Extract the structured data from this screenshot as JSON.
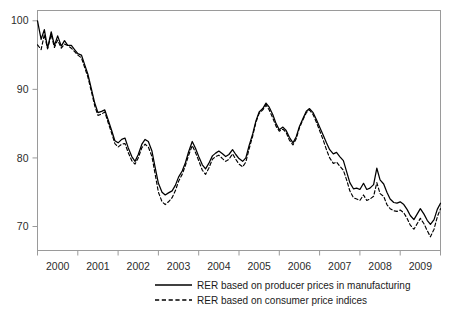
{
  "chart_data": {
    "type": "line",
    "title": "",
    "subtitle": "",
    "xlabel": "",
    "ylabel": "",
    "xlim": [
      1999.58,
      2009.58
    ],
    "ylim": [
      66.5,
      101.5
    ],
    "grid": false,
    "legend_position": "bottom-center",
    "yticks": [
      70,
      80,
      90,
      100
    ],
    "ytick_labels": [
      "70",
      "80",
      "90",
      "100"
    ],
    "xticks": [
      1999.58,
      2000.58,
      2001.58,
      2002.58,
      2003.58,
      2004.58,
      2005.58,
      2006.58,
      2007.58,
      2008.58,
      2009.58
    ],
    "xtick_labels": [
      "2000",
      "2001",
      "2002",
      "2003",
      "2004",
      "2005",
      "2006",
      "2007",
      "2008",
      "2009"
    ],
    "annotations": [],
    "series": [
      {
        "name": "RER based on producer prices in manufacturing",
        "style": "solid",
        "color": "#000000",
        "x": [
          1999.58,
          1999.67,
          1999.75,
          1999.83,
          1999.92,
          2000.0,
          2000.08,
          2000.17,
          2000.25,
          2000.33,
          2000.42,
          2000.5,
          2000.58,
          2000.67,
          2000.75,
          2000.83,
          2000.92,
          2001.0,
          2001.08,
          2001.17,
          2001.25,
          2001.33,
          2001.42,
          2001.5,
          2001.58,
          2001.67,
          2001.75,
          2001.83,
          2001.92,
          2002.0,
          2002.08,
          2002.17,
          2002.25,
          2002.33,
          2002.42,
          2002.5,
          2002.58,
          2002.67,
          2002.75,
          2002.83,
          2002.92,
          2003.0,
          2003.08,
          2003.17,
          2003.25,
          2003.33,
          2003.42,
          2003.5,
          2003.58,
          2003.67,
          2003.75,
          2003.83,
          2003.92,
          2004.0,
          2004.08,
          2004.17,
          2004.25,
          2004.33,
          2004.42,
          2004.5,
          2004.58,
          2004.67,
          2004.75,
          2004.83,
          2004.92,
          2005.0,
          2005.08,
          2005.17,
          2005.25,
          2005.33,
          2005.42,
          2005.5,
          2005.58,
          2005.67,
          2005.75,
          2005.83,
          2005.92,
          2006.0,
          2006.08,
          2006.17,
          2006.25,
          2006.33,
          2006.42,
          2006.5,
          2006.58,
          2006.67,
          2006.75,
          2006.83,
          2006.92,
          2007.0,
          2007.08,
          2007.17,
          2007.25,
          2007.33,
          2007.42,
          2007.5,
          2007.58,
          2007.67,
          2007.75,
          2007.83,
          2007.92,
          2008.0,
          2008.08,
          2008.17,
          2008.25,
          2008.33,
          2008.42,
          2008.5,
          2008.58,
          2008.67,
          2008.75,
          2008.83,
          2008.92,
          2009.0,
          2009.08,
          2009.17,
          2009.25,
          2009.33,
          2009.42,
          2009.5,
          2009.58
        ],
        "values": [
          100.0,
          97.3,
          98.7,
          96.0,
          98.4,
          96.4,
          97.8,
          96.3,
          97.1,
          96.4,
          96.4,
          95.8,
          95.2,
          95.0,
          93.6,
          92.2,
          90.0,
          88.0,
          86.6,
          86.8,
          87.0,
          85.6,
          84.0,
          82.5,
          82.2,
          82.7,
          82.9,
          81.5,
          80.2,
          79.5,
          80.5,
          82.0,
          82.7,
          82.4,
          81.0,
          78.6,
          76.3,
          75.0,
          74.6,
          74.9,
          75.2,
          76.0,
          77.2,
          78.1,
          79.3,
          80.9,
          82.4,
          81.4,
          80.2,
          79.0,
          78.4,
          79.2,
          80.3,
          80.7,
          81.0,
          80.6,
          80.2,
          80.5,
          81.2,
          80.5,
          79.9,
          79.5,
          80.0,
          81.8,
          83.5,
          85.4,
          86.7,
          87.2,
          88.0,
          87.4,
          86.3,
          85.0,
          84.1,
          84.5,
          84.0,
          83.0,
          82.2,
          83.1,
          84.6,
          85.8,
          86.8,
          87.2,
          86.6,
          85.6,
          84.5,
          83.3,
          82.2,
          81.2,
          80.6,
          80.8,
          80.2,
          79.6,
          78.0,
          76.4,
          75.5,
          75.6,
          75.4,
          76.3,
          75.4,
          75.6,
          76.1,
          78.5,
          76.8,
          76.2,
          75.0,
          74.0,
          73.5,
          73.4,
          73.6,
          73.2,
          72.5,
          71.6,
          71.0,
          71.8,
          72.6,
          71.8,
          70.9,
          70.3,
          71.0,
          72.5,
          73.4
        ]
      },
      {
        "name": "RER based on consumer price indices",
        "style": "dashed",
        "color": "#000000",
        "x": [
          1999.58,
          1999.67,
          1999.75,
          1999.83,
          1999.92,
          2000.0,
          2000.08,
          2000.17,
          2000.25,
          2000.33,
          2000.42,
          2000.5,
          2000.58,
          2000.67,
          2000.75,
          2000.83,
          2000.92,
          2001.0,
          2001.08,
          2001.17,
          2001.25,
          2001.33,
          2001.42,
          2001.5,
          2001.58,
          2001.67,
          2001.75,
          2001.83,
          2001.92,
          2002.0,
          2002.08,
          2002.17,
          2002.25,
          2002.33,
          2002.42,
          2002.5,
          2002.58,
          2002.67,
          2002.75,
          2002.83,
          2002.92,
          2003.0,
          2003.08,
          2003.17,
          2003.25,
          2003.33,
          2003.42,
          2003.5,
          2003.58,
          2003.67,
          2003.75,
          2003.83,
          2003.92,
          2004.0,
          2004.08,
          2004.17,
          2004.25,
          2004.33,
          2004.42,
          2004.5,
          2004.58,
          2004.67,
          2004.75,
          2004.83,
          2004.92,
          2005.0,
          2005.08,
          2005.17,
          2005.25,
          2005.33,
          2005.42,
          2005.5,
          2005.58,
          2005.67,
          2005.75,
          2005.83,
          2005.92,
          2006.0,
          2006.08,
          2006.17,
          2006.25,
          2006.33,
          2006.42,
          2006.5,
          2006.58,
          2006.67,
          2006.75,
          2006.83,
          2006.92,
          2007.0,
          2007.08,
          2007.17,
          2007.25,
          2007.33,
          2007.42,
          2007.5,
          2007.58,
          2007.67,
          2007.75,
          2007.83,
          2007.92,
          2008.0,
          2008.08,
          2008.17,
          2008.25,
          2008.33,
          2008.42,
          2008.5,
          2008.58,
          2008.67,
          2008.75,
          2008.83,
          2008.92,
          2009.0,
          2009.08,
          2009.17,
          2009.25,
          2009.33,
          2009.42,
          2009.5,
          2009.58
        ],
        "values": [
          96.5,
          95.8,
          98.0,
          95.9,
          98.0,
          96.1,
          97.2,
          96.0,
          96.6,
          96.4,
          96.0,
          95.5,
          95.0,
          94.6,
          93.2,
          91.8,
          89.6,
          87.6,
          86.2,
          86.4,
          86.7,
          85.2,
          83.6,
          82.1,
          81.6,
          82.0,
          82.1,
          80.8,
          79.6,
          79.1,
          80.0,
          81.5,
          82.0,
          81.6,
          80.2,
          77.6,
          75.0,
          73.6,
          73.2,
          73.6,
          74.2,
          75.2,
          76.6,
          77.6,
          78.9,
          80.4,
          81.8,
          80.8,
          79.6,
          78.2,
          77.6,
          78.5,
          79.8,
          80.2,
          80.4,
          79.9,
          79.5,
          79.8,
          80.6,
          79.8,
          79.1,
          78.7,
          79.4,
          81.3,
          83.2,
          85.2,
          86.5,
          87.0,
          87.7,
          87.0,
          85.8,
          84.6,
          83.9,
          84.2,
          83.7,
          82.6,
          81.9,
          82.8,
          84.4,
          85.6,
          86.6,
          87.0,
          86.3,
          85.2,
          84.0,
          82.6,
          81.2,
          80.0,
          79.2,
          79.4,
          78.8,
          78.2,
          76.8,
          75.2,
          74.2,
          74.0,
          73.8,
          74.6,
          73.8,
          74.0,
          74.4,
          76.4,
          74.8,
          74.4,
          73.2,
          72.6,
          72.3,
          72.2,
          72.4,
          72.0,
          71.2,
          70.2,
          69.6,
          70.4,
          71.2,
          70.4,
          69.4,
          68.5,
          69.6,
          71.4,
          72.6
        ]
      }
    ]
  },
  "legend": {
    "entries": [
      {
        "label": "RER based on producer prices in manufacturing",
        "style": "solid"
      },
      {
        "label": "RER based on consumer price indices",
        "style": "dashed"
      }
    ]
  },
  "axes": {
    "y_tick_labels": [
      "100",
      "90",
      "80",
      "70"
    ],
    "x_tick_labels": [
      "2000",
      "2001",
      "2002",
      "2003",
      "2004",
      "2005",
      "2006",
      "2007",
      "2008",
      "2009"
    ]
  },
  "colors": {
    "line": "#000000",
    "frame": "#9a9a9a",
    "text": "#2b2b2b",
    "background": "#ffffff"
  }
}
